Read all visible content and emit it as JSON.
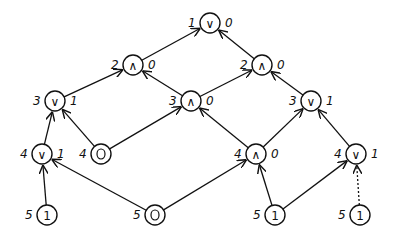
{
  "diagram": {
    "nodes": [
      {
        "id": "n1",
        "op": "∨",
        "depth": "1",
        "value": "0",
        "x": 210,
        "y": 23
      },
      {
        "id": "n2a",
        "op": "∧",
        "depth": "2",
        "value": "0",
        "x": 133,
        "y": 65
      },
      {
        "id": "n2b",
        "op": "∧",
        "depth": "2",
        "value": "0",
        "x": 262,
        "y": 65
      },
      {
        "id": "n3a",
        "op": "∨",
        "depth": "3",
        "value": "1",
        "x": 55,
        "y": 101
      },
      {
        "id": "n3b",
        "op": "∧",
        "depth": "3",
        "value": "0",
        "x": 191,
        "y": 101
      },
      {
        "id": "n3c",
        "op": "∨",
        "depth": "3",
        "value": "1",
        "x": 311,
        "y": 101
      },
      {
        "id": "n4a",
        "op": "∨",
        "depth": "4",
        "value": "1",
        "x": 42,
        "y": 154
      },
      {
        "id": "n4b",
        "op": "0",
        "depth": "4",
        "value": "",
        "x": 101,
        "y": 154,
        "leaf": true
      },
      {
        "id": "n4c",
        "op": "∧",
        "depth": "4",
        "value": "0",
        "x": 256,
        "y": 154
      },
      {
        "id": "n4d",
        "op": "∨",
        "depth": "4",
        "value": "1",
        "x": 356,
        "y": 154
      },
      {
        "id": "n5a",
        "op": "1",
        "depth": "5",
        "value": "",
        "x": 47,
        "y": 215,
        "leaf": true
      },
      {
        "id": "n5b",
        "op": "0",
        "depth": "5",
        "value": "",
        "x": 155,
        "y": 215,
        "leaf": true
      },
      {
        "id": "n5c",
        "op": "1",
        "depth": "5",
        "value": "",
        "x": 275,
        "y": 215,
        "leaf": true
      },
      {
        "id": "n5d",
        "op": "1",
        "depth": "5",
        "value": "",
        "x": 360,
        "y": 215,
        "leaf": true
      }
    ],
    "edges": [
      {
        "from": "n2a",
        "to": "n1"
      },
      {
        "from": "n2b",
        "to": "n1"
      },
      {
        "from": "n3a",
        "to": "n2a"
      },
      {
        "from": "n3b",
        "to": "n2a"
      },
      {
        "from": "n3b",
        "to": "n2b"
      },
      {
        "from": "n3c",
        "to": "n2b"
      },
      {
        "from": "n4a",
        "to": "n3a"
      },
      {
        "from": "n4b",
        "to": "n3a"
      },
      {
        "from": "n4b",
        "to": "n3b"
      },
      {
        "from": "n4c",
        "to": "n3b"
      },
      {
        "from": "n4c",
        "to": "n3c"
      },
      {
        "from": "n4d",
        "to": "n3c"
      },
      {
        "from": "n5a",
        "to": "n4a"
      },
      {
        "from": "n5b",
        "to": "n4a"
      },
      {
        "from": "n5b",
        "to": "n4c"
      },
      {
        "from": "n5c",
        "to": "n4c"
      },
      {
        "from": "n5c",
        "to": "n4d"
      },
      {
        "from": "n5d",
        "to": "n4d",
        "dashed": true
      }
    ]
  }
}
